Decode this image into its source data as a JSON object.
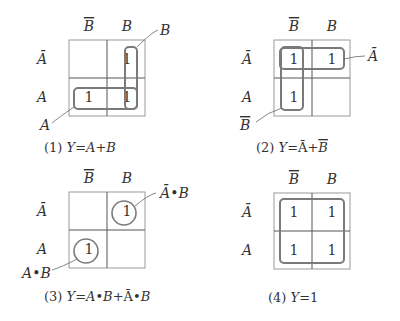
{
  "colors": {
    "grid_outer": "#9a9a9a",
    "grid_inner": "#555555",
    "loop": "#7a7a7a",
    "text": "#333333"
  },
  "maps": [
    {
      "id": "map-1",
      "origin": [
        69,
        40
      ],
      "size": 76,
      "col_headers": [
        "B̄",
        "B"
      ],
      "row_headers": [
        "Ā",
        "A"
      ],
      "cells": [
        [
          "",
          "1"
        ],
        [
          "1",
          "1"
        ]
      ],
      "caption": "(1) Y=A+B",
      "caption_pos": [
        44,
        152
      ],
      "groups": [
        {
          "type": "rect",
          "x": 125,
          "y": 47,
          "w": 12,
          "h": 62,
          "label": "B",
          "leader": [
            [
              137,
              47
            ],
            [
              152,
              32
            ],
            [
              158,
              30
            ]
          ],
          "label_pos": [
            160,
            35
          ]
        },
        {
          "type": "rect",
          "x": 74,
          "y": 88,
          "w": 63,
          "h": 21,
          "label": "A",
          "leader": [
            [
              74,
              107
            ],
            [
              58,
              118
            ],
            [
              52,
              123
            ]
          ],
          "label_pos": [
            40,
            130
          ]
        }
      ]
    },
    {
      "id": "map-2",
      "origin": [
        274,
        40
      ],
      "size": 76,
      "col_headers": [
        "B̄",
        "B"
      ],
      "row_headers": [
        "Ā",
        "A"
      ],
      "cells": [
        [
          "1",
          "1"
        ],
        [
          "1",
          ""
        ]
      ],
      "caption": "(2) Y=Ā+B̄",
      "caption_pos": [
        256,
        152
      ],
      "groups": [
        {
          "type": "rect",
          "x": 280,
          "y": 48,
          "w": 64,
          "h": 21,
          "label": "Ā",
          "leader": [
            [
              344,
              59
            ],
            [
              356,
              56
            ],
            [
              365,
              56
            ]
          ],
          "label_pos": [
            368,
            61
          ]
        },
        {
          "type": "rect",
          "x": 281,
          "y": 47,
          "w": 22,
          "h": 63,
          "label": "B̄",
          "leader": [
            [
              282,
              108
            ],
            [
              268,
              112
            ],
            [
              256,
              122
            ]
          ],
          "label_pos": [
            240,
            130
          ]
        }
      ]
    },
    {
      "id": "map-3",
      "origin": [
        69,
        192
      ],
      "size": 76,
      "col_headers": [
        "B̄",
        "B"
      ],
      "row_headers": [
        "Ā",
        "A"
      ],
      "cells": [
        [
          "",
          "1"
        ],
        [
          "1",
          ""
        ]
      ],
      "caption": "(3) Y=A•B+Ā•B",
      "caption_pos": [
        44,
        301
      ],
      "groups": [
        {
          "type": "circle",
          "cx": 124,
          "cy": 213,
          "r": 12,
          "label": "Ā•B",
          "leader": [
            [
              135,
              206
            ],
            [
              148,
              195
            ],
            [
              156,
              193
            ]
          ],
          "label_pos": [
            160,
            198
          ]
        },
        {
          "type": "circle",
          "cx": 86,
          "cy": 251,
          "r": 12,
          "label": "A•B",
          "leader": [
            [
              77,
              259
            ],
            [
              62,
              267
            ],
            [
              52,
              270
            ]
          ],
          "label_pos": [
            22,
            278
          ]
        }
      ]
    },
    {
      "id": "map-4",
      "origin": [
        274,
        193
      ],
      "size": 76,
      "col_headers": [
        "B̄",
        "B"
      ],
      "row_headers": [
        "Ā",
        "A"
      ],
      "cells": [
        [
          "1",
          "1"
        ],
        [
          "1",
          "1"
        ]
      ],
      "caption": "(4) Y=1",
      "caption_pos": [
        268,
        302
      ],
      "groups": [
        {
          "type": "rect",
          "x": 280,
          "y": 199,
          "w": 64,
          "h": 64,
          "label": "",
          "leader": [],
          "label_pos": []
        }
      ]
    }
  ]
}
